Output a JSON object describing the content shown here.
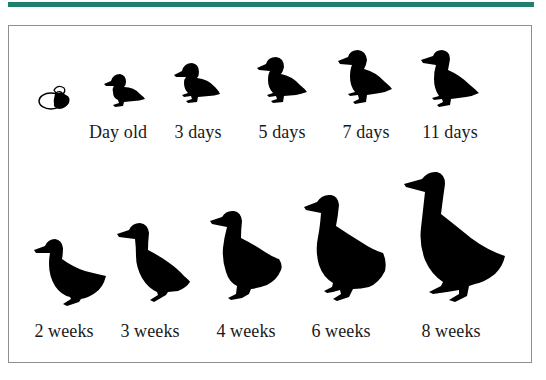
{
  "header": {
    "accent_color": "#1f8070"
  },
  "stages": [
    {
      "id": "hatching",
      "label": ""
    },
    {
      "id": "day-old",
      "label": "Day old"
    },
    {
      "id": "3-days",
      "label": "3 days"
    },
    {
      "id": "5-days",
      "label": "5 days"
    },
    {
      "id": "7-days",
      "label": "7 days"
    },
    {
      "id": "11-days",
      "label": "11 days"
    },
    {
      "id": "2-weeks",
      "label": "2 weeks"
    },
    {
      "id": "3-weeks",
      "label": "3 weeks"
    },
    {
      "id": "4-weeks",
      "label": "4 weeks"
    },
    {
      "id": "6-weeks",
      "label": "6 weeks"
    },
    {
      "id": "8-weeks",
      "label": "8 weeks"
    }
  ]
}
